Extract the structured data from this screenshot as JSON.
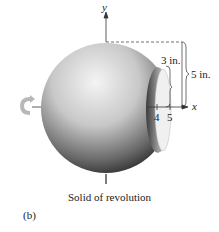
{
  "figure": {
    "caption": "Solid of revolution",
    "panel_label": "(b)",
    "axes": {
      "x_label": "x",
      "y_label": "y"
    },
    "ticks": [
      {
        "value": "4"
      },
      {
        "value": "5"
      }
    ],
    "dimensions": {
      "inner_radius": "3 in.",
      "outer_radius": "5 in."
    },
    "icons": {
      "rotation": "rotation-arrow-icon"
    },
    "colors": {
      "sphere_light": "#f2f2f2",
      "sphere_dark": "#2a2a2a",
      "line": "#333333"
    }
  }
}
